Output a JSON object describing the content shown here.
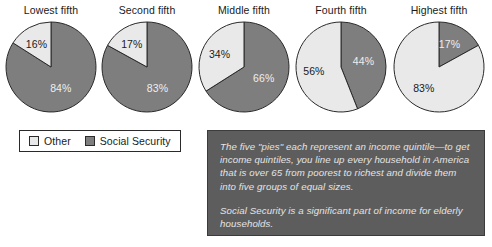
{
  "chart_data": {
    "type": "pie",
    "title": "",
    "subtitle": "",
    "xlabel": "",
    "ylabel": "",
    "legend_position": "bottom-left",
    "grid": false,
    "categories": [
      "Other",
      "Social Security"
    ],
    "charts": [
      {
        "title": "Lowest fifth",
        "slices": [
          {
            "label": "Social Security",
            "value": 84,
            "display": "84%"
          },
          {
            "label": "Other",
            "value": 16,
            "display": "16%"
          }
        ]
      },
      {
        "title": "Second fifth",
        "slices": [
          {
            "label": "Social Security",
            "value": 83,
            "display": "83%"
          },
          {
            "label": "Other",
            "value": 17,
            "display": "17%"
          }
        ]
      },
      {
        "title": "Middle fifth",
        "slices": [
          {
            "label": "Social Security",
            "value": 66,
            "display": "66%"
          },
          {
            "label": "Other",
            "value": 34,
            "display": "34%"
          }
        ]
      },
      {
        "title": "Fourth fifth",
        "slices": [
          {
            "label": "Social Security",
            "value": 44,
            "display": "44%"
          },
          {
            "label": "Other",
            "value": 56,
            "display": "56%"
          }
        ]
      },
      {
        "title": "Highest fifth",
        "slices": [
          {
            "label": "Social Security",
            "value": 17,
            "display": "17%"
          },
          {
            "label": "Other",
            "value": 83,
            "display": "83%"
          }
        ]
      }
    ]
  },
  "legend": {
    "items": [
      {
        "label": "Other",
        "color": "#e9e9e9"
      },
      {
        "label": "Social Security",
        "color": "#7e7e7e"
      }
    ]
  },
  "note": {
    "paragraph1": "The five \"pies\" each represent an income quintile—to get income quintiles, you line up every household in America that is over 65 from poorest to richest and divide them into five groups of equal sizes.",
    "paragraph2": "Social Security is a significant part of income for elderly households."
  },
  "colors": {
    "social_security": "#7e7e7e",
    "other": "#e9e9e9",
    "outline": "#2a2a2a",
    "note_background": "#5d5d5d",
    "note_text": "#e4e4e4",
    "page_background": "#ffffff"
  }
}
